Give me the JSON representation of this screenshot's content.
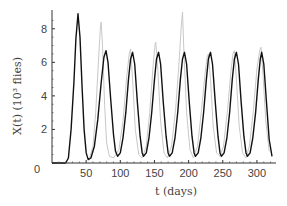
{
  "chart_data": {
    "type": "line",
    "title": "",
    "xlabel": "t (days)",
    "ylabel": "X(t) (10³ flies)",
    "xlim": [
      0,
      325
    ],
    "ylim": [
      0,
      9
    ],
    "grid": false,
    "legend": "none",
    "x_ticks": [
      50,
      100,
      150,
      200,
      250,
      300
    ],
    "x_tick_labels": [
      "50",
      "100",
      "150",
      "200",
      "250",
      "300"
    ],
    "y_ticks": [
      0,
      2,
      4,
      6,
      8
    ],
    "y_tick_labels": [
      "0",
      "2",
      "4",
      "6",
      "8"
    ],
    "series": [
      {
        "name": "model",
        "color": "#111111",
        "points": [
          [
            0,
            0
          ],
          [
            20,
            0
          ],
          [
            24,
            0.3
          ],
          [
            28,
            2.0
          ],
          [
            32,
            4.8
          ],
          [
            35,
            7.4
          ],
          [
            38,
            8.9
          ],
          [
            41,
            7.5
          ],
          [
            44,
            4.5
          ],
          [
            47,
            2.0
          ],
          [
            50,
            0.6
          ],
          [
            53,
            0.2
          ],
          [
            57,
            0.3
          ],
          [
            62,
            1.0
          ],
          [
            67,
            2.6
          ],
          [
            72,
            4.8
          ],
          [
            76,
            6.3
          ],
          [
            79,
            6.7
          ],
          [
            82,
            6.0
          ],
          [
            86,
            3.8
          ],
          [
            90,
            1.7
          ],
          [
            93,
            0.7
          ],
          [
            96,
            0.4
          ],
          [
            100,
            0.6
          ],
          [
            104,
            1.5
          ],
          [
            108,
            3.0
          ],
          [
            112,
            5.0
          ],
          [
            115,
            6.2
          ],
          [
            118,
            6.6
          ],
          [
            121,
            5.9
          ],
          [
            125,
            3.6
          ],
          [
            129,
            1.6
          ],
          [
            132,
            0.6
          ],
          [
            134,
            0.4
          ],
          [
            138,
            0.6
          ],
          [
            142,
            1.5
          ],
          [
            146,
            3.0
          ],
          [
            150,
            5.0
          ],
          [
            153,
            6.2
          ],
          [
            156,
            6.6
          ],
          [
            159,
            5.9
          ],
          [
            163,
            3.6
          ],
          [
            167,
            1.6
          ],
          [
            170,
            0.6
          ],
          [
            172,
            0.4
          ],
          [
            176,
            0.6
          ],
          [
            180,
            1.5
          ],
          [
            184,
            3.0
          ],
          [
            188,
            5.0
          ],
          [
            191,
            6.2
          ],
          [
            194,
            6.6
          ],
          [
            197,
            5.9
          ],
          [
            201,
            3.6
          ],
          [
            205,
            1.6
          ],
          [
            208,
            0.6
          ],
          [
            210,
            0.4
          ],
          [
            214,
            0.6
          ],
          [
            218,
            1.5
          ],
          [
            222,
            3.0
          ],
          [
            226,
            5.0
          ],
          [
            229,
            6.2
          ],
          [
            232,
            6.6
          ],
          [
            235,
            5.9
          ],
          [
            239,
            3.6
          ],
          [
            243,
            1.6
          ],
          [
            246,
            0.6
          ],
          [
            248,
            0.4
          ],
          [
            252,
            0.6
          ],
          [
            256,
            1.5
          ],
          [
            260,
            3.0
          ],
          [
            264,
            5.0
          ],
          [
            267,
            6.2
          ],
          [
            270,
            6.6
          ],
          [
            273,
            5.9
          ],
          [
            277,
            3.6
          ],
          [
            281,
            1.6
          ],
          [
            284,
            0.6
          ],
          [
            286,
            0.4
          ],
          [
            290,
            0.6
          ],
          [
            294,
            1.5
          ],
          [
            298,
            3.0
          ],
          [
            302,
            5.0
          ],
          [
            305,
            6.2
          ],
          [
            307,
            6.6
          ],
          [
            310,
            5.9
          ],
          [
            314,
            3.6
          ],
          [
            318,
            1.4
          ],
          [
            322,
            0.4
          ]
        ]
      },
      {
        "name": "data",
        "color": "#c8c8c8",
        "points": [
          [
            55,
            0.3
          ],
          [
            60,
            1.0
          ],
          [
            64,
            3.0
          ],
          [
            68,
            6.0
          ],
          [
            71,
            8.2
          ],
          [
            72,
            8.4
          ],
          [
            74,
            7.0
          ],
          [
            77,
            3.5
          ],
          [
            80,
            1.2
          ],
          [
            84,
            0.4
          ],
          [
            90,
            0.3
          ],
          [
            98,
            0.8
          ],
          [
            104,
            2.5
          ],
          [
            109,
            5.0
          ],
          [
            113,
            6.5
          ],
          [
            115,
            6.8
          ],
          [
            118,
            5.0
          ],
          [
            122,
            2.0
          ],
          [
            127,
            0.5
          ],
          [
            132,
            0.3
          ],
          [
            138,
            1.0
          ],
          [
            143,
            3.0
          ],
          [
            148,
            5.8
          ],
          [
            151,
            7.1
          ],
          [
            152,
            7.2
          ],
          [
            155,
            5.5
          ],
          [
            159,
            2.5
          ],
          [
            164,
            0.6
          ],
          [
            169,
            0.3
          ],
          [
            175,
            1.0
          ],
          [
            181,
            3.2
          ],
          [
            186,
            6.0
          ],
          [
            189,
            8.0
          ],
          [
            191,
            9.0
          ],
          [
            193,
            6.8
          ],
          [
            197,
            3.0
          ],
          [
            202,
            0.8
          ],
          [
            207,
            0.3
          ],
          [
            213,
            1.0
          ],
          [
            219,
            3.2
          ],
          [
            224,
            5.3
          ],
          [
            227,
            6.3
          ],
          [
            229,
            6.5
          ],
          [
            232,
            5.0
          ],
          [
            236,
            2.2
          ],
          [
            241,
            0.6
          ],
          [
            246,
            0.4
          ],
          [
            251,
            1.0
          ],
          [
            257,
            3.2
          ],
          [
            262,
            5.5
          ],
          [
            265,
            6.5
          ],
          [
            267,
            6.7
          ],
          [
            270,
            5.0
          ],
          [
            274,
            2.2
          ],
          [
            279,
            0.6
          ],
          [
            284,
            0.3
          ],
          [
            289,
            1.0
          ],
          [
            295,
            3.2
          ],
          [
            300,
            5.6
          ],
          [
            304,
            6.7
          ],
          [
            306,
            6.9
          ],
          [
            309,
            5.2
          ],
          [
            313,
            2.5
          ],
          [
            318,
            0.7
          ]
        ]
      }
    ]
  }
}
